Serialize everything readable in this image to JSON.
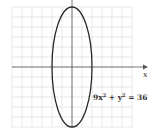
{
  "chart_data": {
    "type": "line",
    "title": "",
    "xlabel": "x",
    "ylabel": "",
    "xlim": [
      -6,
      6
    ],
    "ylim": [
      -6,
      6
    ],
    "grid": true,
    "grid_step": 1,
    "series": [
      {
        "name": "9x^2 + y^2 = 36",
        "kind": "ellipse",
        "center": [
          0,
          0
        ],
        "semi_axis_x": 2,
        "semi_axis_y": 6
      }
    ],
    "annotations": [
      {
        "text_main": "9x",
        "sup1": "2",
        "text_mid": " + y",
        "sup2": "2",
        "text_end": " = 36",
        "anchor": [
          2.1,
          -3.5
        ]
      }
    ]
  }
}
